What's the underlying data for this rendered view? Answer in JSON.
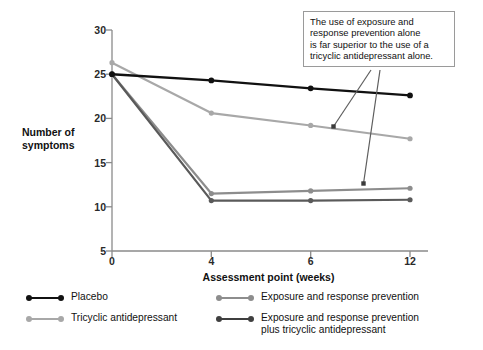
{
  "chart_data": {
    "type": "line",
    "title": "",
    "xlabel": "Assessment point (weeks)",
    "ylabel": "Number of symptoms",
    "categories": [
      "0",
      "4",
      "6",
      "12"
    ],
    "x": [
      0,
      4,
      6,
      12
    ],
    "xlim": [
      0,
      12
    ],
    "ylim": [
      5,
      30
    ],
    "yticks": [
      5,
      10,
      15,
      20,
      25,
      30
    ],
    "xticks": [
      "0",
      "4",
      "6",
      "12"
    ],
    "grid": false,
    "legend_position": "below",
    "series": [
      {
        "name": "Placebo",
        "color": "#111111",
        "values": [
          25.0,
          24.3,
          23.4,
          22.6
        ]
      },
      {
        "name": "Tricyclic antidepressant",
        "color": "#a8a8a8",
        "values": [
          26.3,
          20.6,
          19.2,
          17.7
        ]
      },
      {
        "name": "Exposure and response prevention",
        "color": "#8d8d8d",
        "values": [
          25.0,
          11.5,
          11.8,
          12.1
        ]
      },
      {
        "name": "Exposure and response prevention plus tricyclic antidepressant",
        "color": "#5a5a5a",
        "values": [
          25.0,
          10.7,
          10.7,
          10.8
        ]
      }
    ],
    "annotations": [
      {
        "text": "The use of exposure and response prevention alone is far superior to the use of a tricyclic antidepressant alone.",
        "lines": [
          "The use of exposure and",
          "response prevention alone",
          "is far superior to the use of a",
          "tricyclic antidepressant alone."
        ],
        "leader_targets": [
          "Tricyclic antidepressant",
          "Exposure and response prevention"
        ]
      }
    ]
  },
  "axes": {
    "y_title": "Number of\nsymptoms",
    "y_title_line1": "Number of",
    "y_title_line2": "symptoms",
    "x_title": "Assessment point (weeks)",
    "y_ticks": [
      "30",
      "25",
      "20",
      "15",
      "10",
      "5"
    ],
    "x_ticks": [
      "0",
      "4",
      "6",
      "12"
    ]
  },
  "annotation": {
    "line1": "The use of exposure and",
    "line2": "response prevention alone",
    "line3": "is far superior to the use of a",
    "line4": "tricyclic antidepressant alone."
  },
  "legend": {
    "left": [
      {
        "label": "Placebo",
        "color": "#111111"
      },
      {
        "label": "Tricyclic antidepressant",
        "color": "#a8a8a8"
      }
    ],
    "right": [
      {
        "label": "Exposure and response prevention",
        "color": "#8d8d8d"
      },
      {
        "label": "Exposure and response prevention\nplus tricyclic antidepressant",
        "color": "#5a5a5a"
      }
    ]
  },
  "colors": {
    "placebo": "#111111",
    "tricyclic": "#a8a8a8",
    "erp": "#8d8d8d",
    "erp_plus_tricyclic": "#5a5a5a",
    "axis": "#8a8a8a",
    "annotation_border": "#9a9a9a",
    "text": "#111111",
    "background": "#ffffff"
  }
}
